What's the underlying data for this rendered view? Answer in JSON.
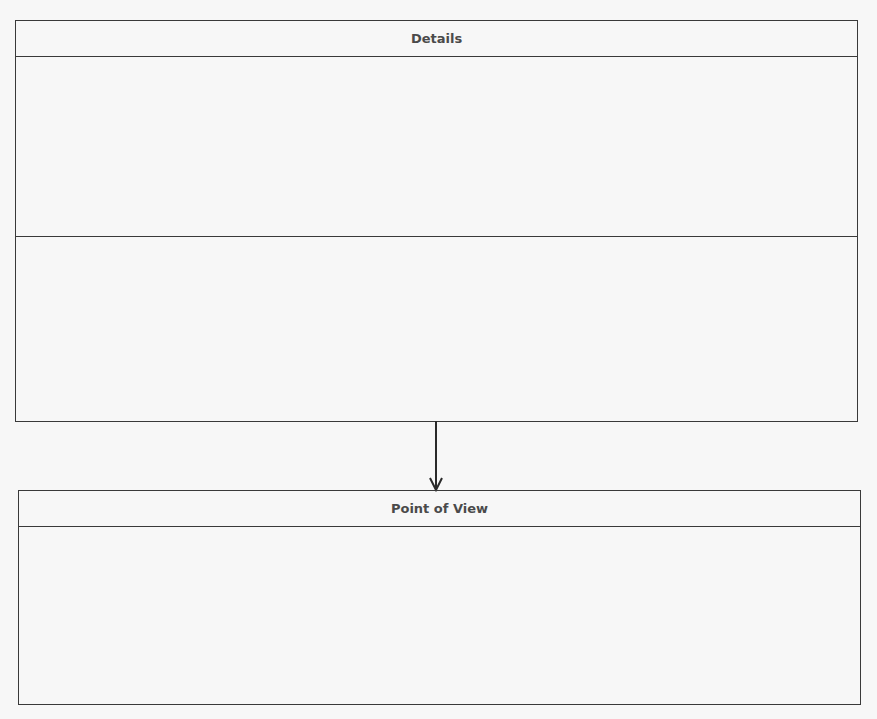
{
  "diagram": {
    "nodes": [
      {
        "id": "details",
        "title": "Details",
        "sections": 2
      },
      {
        "id": "point-of-view",
        "title": "Point of View",
        "sections": 1
      }
    ],
    "edges": [
      {
        "from": "details",
        "to": "point-of-view",
        "type": "arrow"
      }
    ],
    "colors": {
      "line": "#3a3a3a",
      "text": "#4a4a4a",
      "background": "#f7f7f7"
    }
  }
}
